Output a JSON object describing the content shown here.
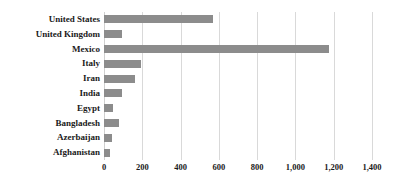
{
  "chart_data": {
    "type": "bar",
    "orientation": "horizontal",
    "title": "",
    "subtitle": "",
    "xlabel": "",
    "ylabel": "",
    "categories": [
      "United States",
      "United Kingdom",
      "Mexico",
      "Italy",
      "Iran",
      "India",
      "Egypt",
      "Bangladesh",
      "Azerbaijan",
      "Afghanistan"
    ],
    "values": [
      570,
      94,
      1175,
      193,
      162,
      94,
      47,
      78,
      42,
      31
    ],
    "series": [
      {
        "name": "",
        "values": [
          570,
          94,
          1175,
          193,
          162,
          94,
          47,
          78,
          42,
          31
        ]
      }
    ],
    "xlim": [
      0,
      1400
    ],
    "xticks": [
      0,
      200,
      400,
      600,
      800,
      1000,
      1200,
      1400
    ],
    "xtick_labels": [
      "0",
      "200",
      "400",
      "600",
      "800",
      "1,000",
      "1,200",
      "1,400"
    ],
    "grid": "vertical",
    "legend": "none",
    "bar_color": "#8c8c8c",
    "grid_color": "#d9d9d9",
    "background_color": "#ffffff"
  }
}
